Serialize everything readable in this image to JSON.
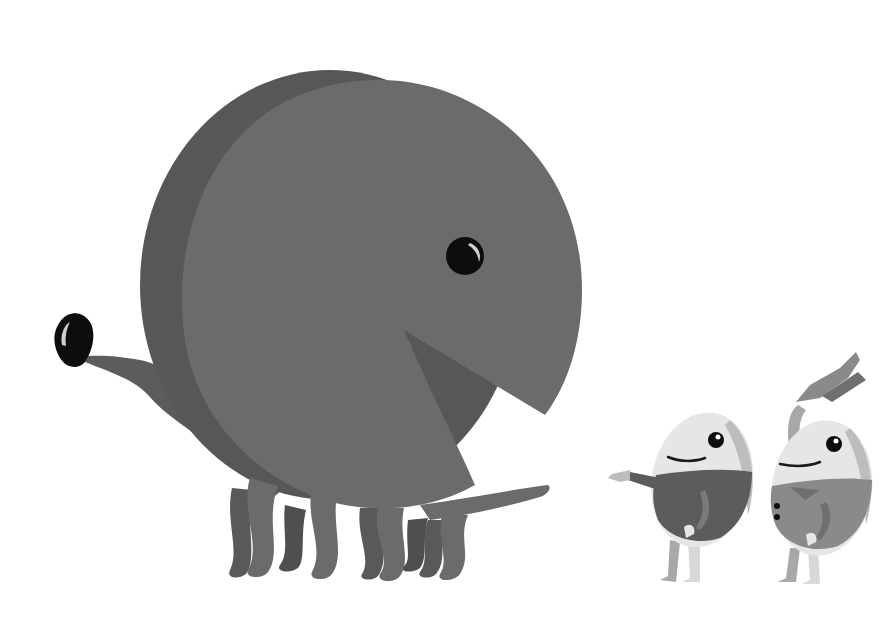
{
  "scene": {
    "description": "Grayscale illustration: giant pac-man shaped dinosaur creature and two egg characters",
    "background": "#ffffff",
    "colors": {
      "body_main": "#6b6b6b",
      "body_shadow": "#575757",
      "legs_back": "#4f4f4f",
      "eye": "#0d0d0d",
      "eye_highlight": "#cfcfcf",
      "egg_shell": "#e6e6e6",
      "egg_shade": "#bdbdbd",
      "suit_dark": "#5c5c5c",
      "suit_light": "#8a8a8a",
      "limb": "#a8a8a8"
    }
  },
  "characters": [
    {
      "name": "pacman-dinosaur",
      "features": [
        "eye",
        "open-mouth",
        "long-neck",
        "small-head",
        "six-legs",
        "tail"
      ]
    },
    {
      "name": "egg-character-left",
      "pose": "pointing"
    },
    {
      "name": "egg-character-right",
      "pose": "raising-hat"
    }
  ]
}
